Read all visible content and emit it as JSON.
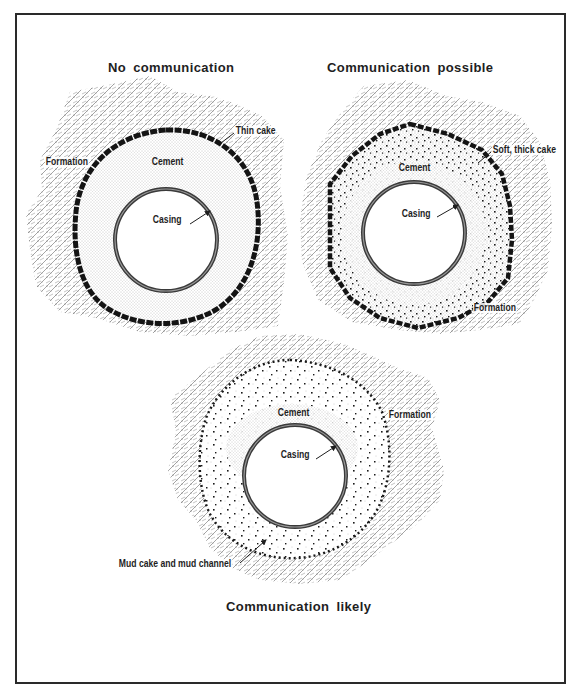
{
  "figure": {
    "panels": [
      {
        "id": "no-communication",
        "title": "No communication",
        "labels": {
          "formation": "Formation",
          "cement": "Cement",
          "casing": "Casing",
          "cake": "Thin cake"
        }
      },
      {
        "id": "communication-possible",
        "title": "Communication possible",
        "labels": {
          "cake": "Soft, thick cake",
          "cement": "Cement",
          "casing": "Casing",
          "formation": "Formation"
        }
      },
      {
        "id": "communication-likely",
        "title": "Communication likely",
        "labels": {
          "cement": "Cement",
          "formation": "Formation",
          "casing": "Casing",
          "channel": "Mud cake and mud channel"
        }
      }
    ],
    "colors": {
      "ink": "#1e1e1e",
      "formation": "#8a8a8a",
      "cement": "#b0b0b0",
      "casing": "#3a3a3a",
      "background": "#ffffff"
    }
  }
}
